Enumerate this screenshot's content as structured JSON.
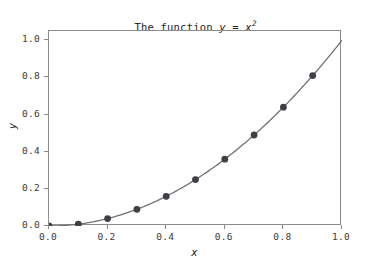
{
  "chart_data": {
    "type": "line",
    "title_parts": {
      "prefix": "The function ",
      "var_y": "y",
      "equals": " = ",
      "var_x": "x",
      "exponent": "2"
    },
    "xlabel": "x",
    "ylabel": "y",
    "xlim": [
      0.0,
      1.0
    ],
    "ylim": [
      0.0,
      1.05
    ],
    "grid": false,
    "legend": null,
    "x_ticks": [
      0.0,
      0.2,
      0.4,
      0.6,
      0.8,
      1.0
    ],
    "x_tick_labels": [
      "0.0",
      "0.2",
      "0.4",
      "0.6",
      "0.8",
      "1.0"
    ],
    "y_ticks": [
      0.0,
      0.2,
      0.4,
      0.6,
      0.8,
      1.0
    ],
    "y_tick_labels": [
      "0.0",
      "0.2",
      "0.4",
      "0.6",
      "0.8",
      "1.0"
    ],
    "series": [
      {
        "name": "y = x^2",
        "style": "line-with-markers",
        "line_color": "#707070",
        "marker_color": "#3f3f46",
        "marker": "circle",
        "x": [
          0.0,
          0.1,
          0.2,
          0.3,
          0.4,
          0.5,
          0.6,
          0.7,
          0.8,
          0.9
        ],
        "values": [
          0.0,
          0.01,
          0.04,
          0.09,
          0.16,
          0.25,
          0.36,
          0.49,
          0.64,
          0.81
        ]
      },
      {
        "name": "curve-extension",
        "style": "line",
        "line_color": "#707070",
        "x": [
          0.9,
          0.95,
          1.0
        ],
        "values": [
          0.81,
          0.9025,
          1.0
        ]
      }
    ],
    "colors": {
      "line": "#707070",
      "marker": "#3f3f46",
      "spine": "#8c8c8c",
      "tick_label": "#3a3a3a",
      "text": "#262626",
      "background": "#ffffff"
    }
  }
}
